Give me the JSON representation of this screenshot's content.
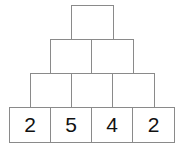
{
  "pyramid": {
    "rows": [
      {
        "cells": [
          ""
        ]
      },
      {
        "cells": [
          "",
          ""
        ]
      },
      {
        "cells": [
          "",
          "",
          ""
        ]
      },
      {
        "cells": [
          "2",
          "5",
          "4",
          "2"
        ]
      }
    ]
  }
}
